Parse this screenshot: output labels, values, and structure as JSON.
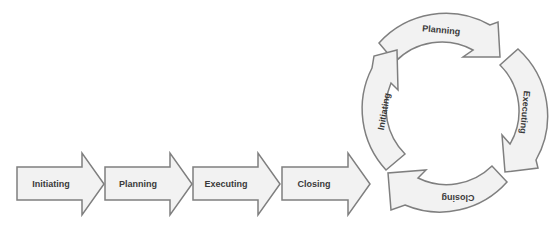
{
  "diagram": {
    "type": "process-flow",
    "colors": {
      "fill": "#f2f2f2",
      "stroke": "#7f7f7f",
      "text": "#3a3a3a"
    },
    "linear_steps": [
      {
        "label": "Initiating"
      },
      {
        "label": "Planning"
      },
      {
        "label": "Executing"
      },
      {
        "label": "Closing"
      }
    ],
    "cycle_steps": [
      {
        "label": "Planning"
      },
      {
        "label": "Executing"
      },
      {
        "label": "Closing"
      },
      {
        "label": "Initiating"
      }
    ]
  }
}
